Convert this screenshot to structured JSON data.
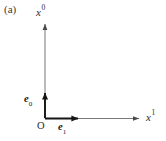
{
  "figure": {
    "panel_letter": "(a)",
    "background_color": "#ffffff",
    "line_color": "#5a5a5a",
    "vector_color": "#1a1a1a",
    "text_color": "#2b2b2b",
    "origin_label": "O",
    "axes": [
      {
        "name": "vertical-axis",
        "base": "x",
        "superscript": "0",
        "label": "x0",
        "direction": "up",
        "from": [
          45,
          118
        ],
        "to": [
          45,
          22
        ]
      },
      {
        "name": "horizontal-axis",
        "base": "x",
        "superscript": "1",
        "label": "x1",
        "direction": "right",
        "from": [
          45,
          118
        ],
        "to": [
          140,
          118
        ]
      }
    ],
    "basis_vectors": [
      {
        "name": "basis-vector-e0",
        "base": "e",
        "subscript": "0",
        "label": "e0",
        "direction": "up",
        "from": [
          45,
          118
        ],
        "to": [
          45,
          90
        ]
      },
      {
        "name": "basis-vector-e1",
        "base": "e",
        "subscript": "1",
        "label": "e1",
        "direction": "right",
        "from": [
          45,
          118
        ],
        "to": [
          80,
          118
        ]
      }
    ]
  }
}
